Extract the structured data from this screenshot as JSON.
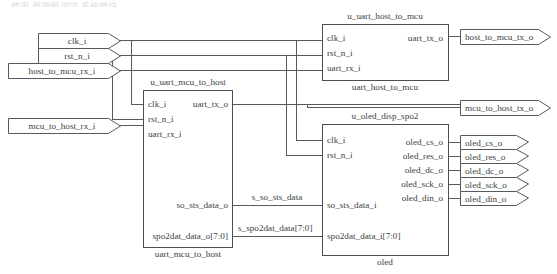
{
  "diagram": {
    "title_cropped": "— 使用 原理图 浏览 系统模块",
    "colors": {
      "wire": "#555a5e",
      "box_stroke": "#4a4f53",
      "text": "#3b3f42",
      "background": "#ffffff"
    }
  },
  "input_ports": [
    {
      "name": "clk_i",
      "label": "clk_i",
      "x": 38,
      "y": 33,
      "w": 82,
      "h": 15
    },
    {
      "name": "rst_n_i",
      "label": "rst_n_i",
      "x": 38,
      "y": 48,
      "w": 82,
      "h": 15
    },
    {
      "name": "host_to_mcu_rx_i",
      "label": "host_to_mcu_rx_i",
      "x": 8,
      "y": 63,
      "w": 112,
      "h": 15
    },
    {
      "name": "mcu_to_host_rx_i",
      "label": "mcu_to_host_rx_i",
      "x": 8,
      "y": 118,
      "w": 112,
      "h": 15
    }
  ],
  "output_ports": [
    {
      "name": "host_to_mcu_tx_o",
      "label": "host_to_mcu_tx_o",
      "x": 460,
      "y": 29,
      "w": 90,
      "h": 15
    },
    {
      "name": "mcu_to_host_tx_o",
      "label": "mcu_to_host_tx_o",
      "x": 460,
      "y": 100,
      "w": 90,
      "h": 15
    },
    {
      "name": "oled_cs_o",
      "label": "oled_cs_o",
      "x": 460,
      "y": 135,
      "w": 68,
      "h": 14
    },
    {
      "name": "oled_res_o",
      "label": "oled_res_o",
      "x": 460,
      "y": 149,
      "w": 68,
      "h": 14
    },
    {
      "name": "oled_dc_o",
      "label": "oled_dc_o",
      "x": 460,
      "y": 163,
      "w": 68,
      "h": 14
    },
    {
      "name": "oled_sck_o",
      "label": "oled_sck_o",
      "x": 460,
      "y": 177,
      "w": 68,
      "h": 14
    },
    {
      "name": "oled_din_o",
      "label": "oled_din_o",
      "x": 460,
      "y": 191,
      "w": 68,
      "h": 14
    }
  ],
  "blocks": [
    {
      "id": "u_uart_host_to_mcu",
      "instance_label": "u_uart_host_to_mcu",
      "type_label": "uart_host_to_mcu",
      "x": 322,
      "y": 24,
      "w": 126,
      "h": 56,
      "inputs": [
        {
          "name": "clk_i",
          "label": "clk_i",
          "y": 38
        },
        {
          "name": "rst_n_i",
          "label": "rst_n_i",
          "y": 53
        },
        {
          "name": "uart_rx_i",
          "label": "uart_rx_i",
          "y": 68
        }
      ],
      "outputs": [
        {
          "name": "uart_tx_o",
          "label": "uart_tx_o",
          "y": 38
        }
      ]
    },
    {
      "id": "u_uart_mcu_to_host",
      "instance_label": "u_uart_mcu_to_host",
      "type_label": "uart_mcu_to_host",
      "x": 143,
      "y": 90,
      "w": 89,
      "h": 157,
      "inputs": [
        {
          "name": "clk_i",
          "label": "clk_i",
          "y": 104
        },
        {
          "name": "rst_n_i",
          "label": "rst_n_i",
          "y": 119
        },
        {
          "name": "uart_rx_i",
          "label": "uart_rx_i",
          "y": 134
        }
      ],
      "outputs": [
        {
          "name": "uart_tx_o",
          "label": "uart_tx_o",
          "y": 104
        },
        {
          "name": "so_sts_data_o",
          "label": "so_sts_data_o",
          "y": 205
        },
        {
          "name": "spo2dat_data_o",
          "label": "spo2dat_data_o[7:0]",
          "y": 236
        }
      ]
    },
    {
      "id": "u_oled_disp_spo2",
      "instance_label": "u_oled_disp_spo2",
      "type_label": "oled",
      "x": 322,
      "y": 124,
      "w": 126,
      "h": 131,
      "inputs": [
        {
          "name": "clk_i",
          "label": "clk_i",
          "y": 140
        },
        {
          "name": "rst_n_i",
          "label": "rst_n_i",
          "y": 155
        },
        {
          "name": "so_sts_data_i",
          "label": "so_sts_data_i",
          "y": 205
        },
        {
          "name": "spo2dat_data_i",
          "label": "spo2dat_data_i[7:0]",
          "y": 236
        }
      ],
      "outputs": [
        {
          "name": "oled_cs_o",
          "label": "oled_cs_o",
          "y": 142
        },
        {
          "name": "oled_res_o",
          "label": "oled_res_o",
          "y": 156
        },
        {
          "name": "oled_dc_o",
          "label": "oled_dc_o",
          "y": 170
        },
        {
          "name": "oled_sck_o",
          "label": "oled_sck_o",
          "y": 184
        },
        {
          "name": "oled_din_o",
          "label": "oled_din_o",
          "y": 198
        }
      ]
    }
  ],
  "net_labels": [
    {
      "name": "s_so_sts_data",
      "label": "s_so_sts_data",
      "x": 277,
      "y": 197
    },
    {
      "name": "s_spo2dat_data",
      "label": "s_spo2dat_data[7:0]",
      "x": 238,
      "y": 228
    }
  ]
}
